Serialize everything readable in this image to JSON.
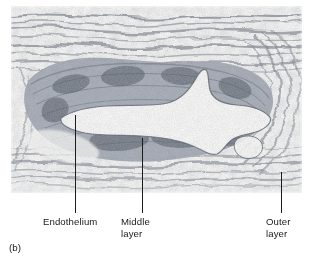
{
  "figure": {
    "caption_label": "(b)",
    "image_kind": "light-micrograph",
    "background_color": "#ffffff",
    "tissue_tone": "#8d9099",
    "lumen_color": "#f4f4f2",
    "line_color": "#1c1c1c"
  },
  "callouts": [
    {
      "id": "endothelium",
      "label": "Endothelium",
      "leader": {
        "x": 75,
        "y_top": 115,
        "y_bottom": 213
      }
    },
    {
      "id": "middle-layer",
      "label": "Middle\nlayer",
      "leader": {
        "x": 142,
        "y_top": 138,
        "y_bottom": 213
      }
    },
    {
      "id": "outer-layer",
      "label": "Outer\nlayer",
      "leader": {
        "x": 281,
        "y_top": 172,
        "y_bottom": 213
      }
    }
  ]
}
